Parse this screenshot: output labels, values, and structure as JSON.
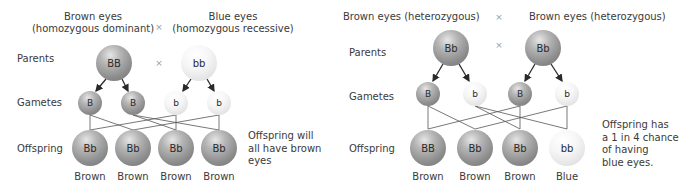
{
  "left_panel": {
    "parent1_header": {
      "line1": "Brown eyes",
      "line2": "(homozygous dominant)"
    },
    "parent2_header": {
      "line1": "Blue eyes",
      "line2": "(homozygous recessive)"
    },
    "cross_symbol": "×",
    "row_labels": {
      "parents": "Parents",
      "gametes": "Gametes",
      "offspring": "Offspring"
    },
    "parents": [
      {
        "genotype": "BB",
        "shade": "dark"
      },
      {
        "genotype": "bb",
        "shade": "light"
      }
    ],
    "gametes": [
      {
        "allele": "B",
        "shade": "dark"
      },
      {
        "allele": "B",
        "shade": "dark"
      },
      {
        "allele": "b",
        "shade": "light"
      },
      {
        "allele": "b",
        "shade": "light"
      }
    ],
    "offspring": [
      {
        "genotype": "Bb",
        "phenotype": "Brown",
        "shade": "dark"
      },
      {
        "genotype": "Bb",
        "phenotype": "Brown",
        "shade": "dark"
      },
      {
        "genotype": "Bb",
        "phenotype": "Brown",
        "shade": "dark"
      },
      {
        "genotype": "Bb",
        "phenotype": "Brown",
        "shade": "dark"
      }
    ],
    "note": {
      "line1": "Offspring will",
      "line2": "all have brown",
      "line3": "eyes"
    }
  },
  "right_panel": {
    "parent1_header": "Brown eyes (heterozygous)",
    "parent2_header": "Brown eyes (heterozygous)",
    "cross_symbol": "×",
    "row_labels": {
      "parents": "Parents",
      "gametes": "Gametes",
      "offspring": "Offspring"
    },
    "parents": [
      {
        "genotype": "Bb",
        "shade": "dark"
      },
      {
        "genotype": "Bb",
        "shade": "dark"
      }
    ],
    "gametes": [
      {
        "allele": "B",
        "shade": "dark"
      },
      {
        "allele": "b",
        "shade": "light"
      },
      {
        "allele": "B",
        "shade": "dark"
      },
      {
        "allele": "b",
        "shade": "light"
      }
    ],
    "offspring": [
      {
        "genotype": "BB",
        "phenotype": "Brown",
        "shade": "dark"
      },
      {
        "genotype": "Bb",
        "phenotype": "Brown",
        "shade": "dark"
      },
      {
        "genotype": "Bb",
        "phenotype": "Brown",
        "shade": "dark"
      },
      {
        "genotype": "bb",
        "phenotype": "Blue",
        "shade": "light"
      }
    ],
    "note": {
      "line1": "Offspring has",
      "line2": "a 1 in 4 chance",
      "line3": "of having",
      "line4": "blue eyes."
    }
  }
}
